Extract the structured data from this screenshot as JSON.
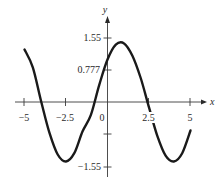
{
  "chart_data": {
    "type": "line",
    "title": "",
    "xlabel": "x",
    "ylabel": "y",
    "xlim": [
      -5,
      5
    ],
    "ylim": [
      -1.55,
      1.55
    ],
    "grid": false,
    "legend": null,
    "x_ticks": [
      -5,
      -2.5,
      0,
      2.5,
      5
    ],
    "x_tick_labels": [
      "−5",
      "−2.5",
      "0",
      "2.5",
      "5"
    ],
    "y_ticks": [
      1.55,
      0.777,
      -0.777,
      -1.55
    ],
    "y_tick_labels": [
      "1.55",
      "0.777",
      "",
      "−1.55"
    ],
    "series": [
      {
        "name": "f(x)",
        "description": "sinusoid approx 1.45*sin(x+0.79)",
        "x": [
          -5,
          -4.5,
          -4,
          -3.5,
          -3,
          -2.5,
          -2,
          -1.5,
          -1,
          -0.5,
          0,
          0.5,
          1,
          1.5,
          2,
          2.5,
          3,
          3.5,
          4,
          4.5,
          5
        ],
        "y": [
          1.27,
          0.84,
          0.02,
          -0.74,
          -1.27,
          -1.44,
          -1.24,
          -0.71,
          -0.31,
          0.41,
          1.03,
          1.39,
          1.42,
          1.12,
          0.58,
          -0.13,
          -0.82,
          -1.3,
          -1.44,
          -1.24,
          -0.69
        ]
      }
    ],
    "extrema": {
      "max": {
        "x": 0.78,
        "y": 1.45
      },
      "min_left": {
        "x": -2.36,
        "y": -1.45
      },
      "min_right": {
        "x": 3.93,
        "y": -1.45
      }
    },
    "zeros": [
      -3.93,
      -0.79,
      2.35
    ]
  },
  "labels": {
    "x_axis": "x",
    "y_axis": "y",
    "xt_m5": "−5",
    "xt_m25": "−2.5",
    "xt_0": "0",
    "xt_25": "2.5",
    "xt_5": "5",
    "yt_155": "1.55",
    "yt_0777": "0.777",
    "yt_m155": "−1.55"
  },
  "colors": {
    "curve": "#1a1a1a",
    "axis": "#3a3a3a",
    "background": "#ffffff"
  }
}
